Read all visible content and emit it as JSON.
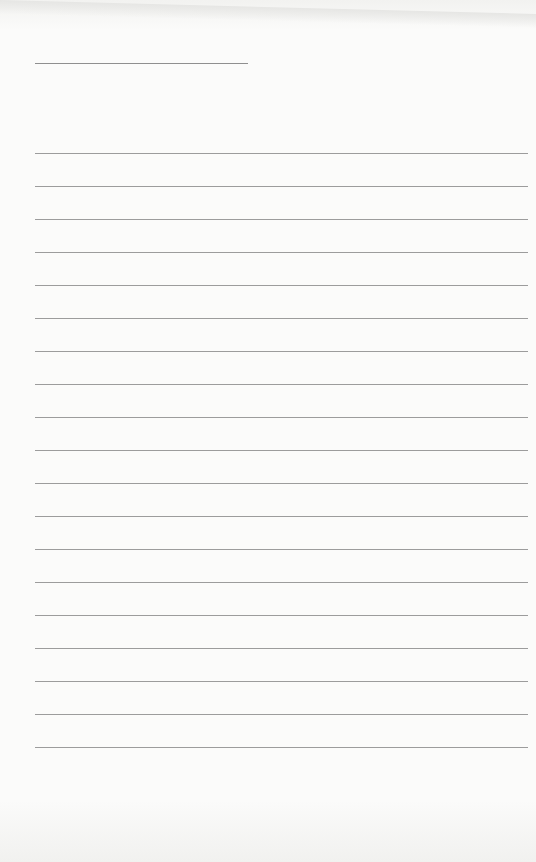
{
  "page": {
    "type": "lined-paper",
    "title_line": {
      "x": 35,
      "y": 63,
      "width": 213
    },
    "rules": {
      "count": 19,
      "start_y": 153,
      "spacing": 33,
      "x": 35,
      "width": 493,
      "color": "#9c9c9c"
    },
    "background_color": "#fbfbfa"
  }
}
